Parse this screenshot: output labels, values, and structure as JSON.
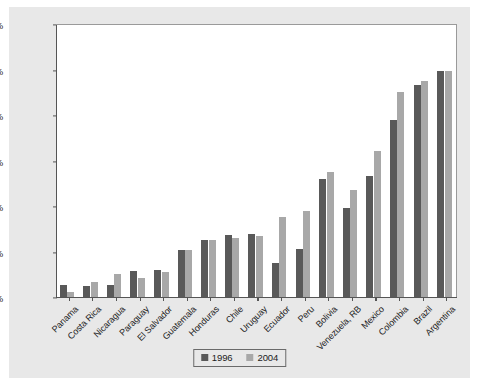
{
  "chart_data": {
    "type": "bar",
    "title": "",
    "subtitle": "",
    "xlabel": "",
    "ylabel": "",
    "ylim": [
      0,
      60
    ],
    "ytick_values": [
      0,
      10,
      20,
      30,
      40,
      50,
      60
    ],
    "ytick_labels": [
      "0%",
      "10%",
      "20%",
      "30%",
      "40%",
      "50%",
      "60%"
    ],
    "grid": false,
    "legend_position": "bottom-center",
    "categories": [
      "Panama",
      "Costa Rica",
      "Nicaragua",
      "Paraguay",
      "El Salvador",
      "Guatemala",
      "Honduras",
      "Chile",
      "Uruguay",
      "Ecuador",
      "Peru",
      "Bolivia",
      "Venezuela, RB",
      "Mexico",
      "Colombia",
      "Brazil",
      "Argentina"
    ],
    "series": [
      {
        "name": "1996",
        "color": "#595959",
        "values": [
          2.6,
          2.5,
          2.6,
          5.8,
          5.9,
          10.3,
          12.5,
          13.7,
          13.8,
          7.4,
          10.5,
          26.0,
          19.5,
          26.5,
          39.0,
          46.5,
          49.7
        ]
      },
      {
        "name": "2004",
        "color": "#a8a8a8",
        "values": [
          1.0,
          3.4,
          5.0,
          4.2,
          5.4,
          10.3,
          12.5,
          13.0,
          13.5,
          17.5,
          19.0,
          27.5,
          23.5,
          32.0,
          45.0,
          47.5,
          49.7
        ]
      }
    ]
  },
  "legend": {
    "entries": [
      {
        "label": "1996",
        "color": "#595959"
      },
      {
        "label": "2004",
        "color": "#a8a8a8"
      }
    ]
  }
}
